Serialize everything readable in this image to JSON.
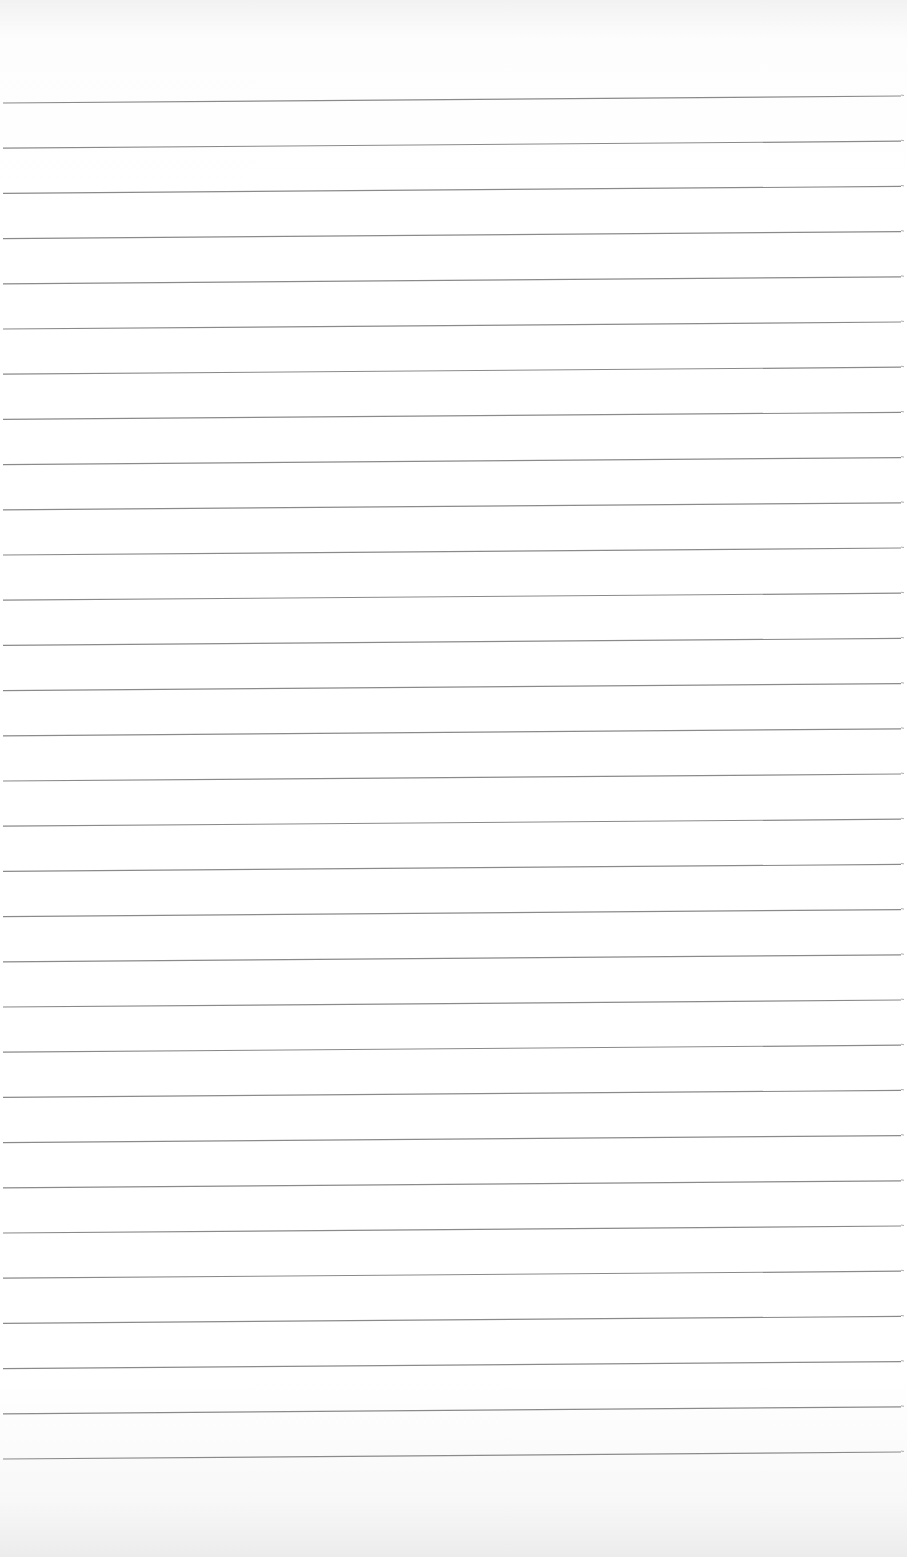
{
  "page": {
    "kind": "blank lined notebook paper",
    "background_color": "#ffffff",
    "line_color": "#8a8a8a",
    "line_count": 31,
    "line_spacing_px": 45.2,
    "first_line_left_y": 103,
    "first_line_right_y": 96,
    "line_start_x": 3,
    "line_end_x": 901,
    "text_content": ""
  }
}
